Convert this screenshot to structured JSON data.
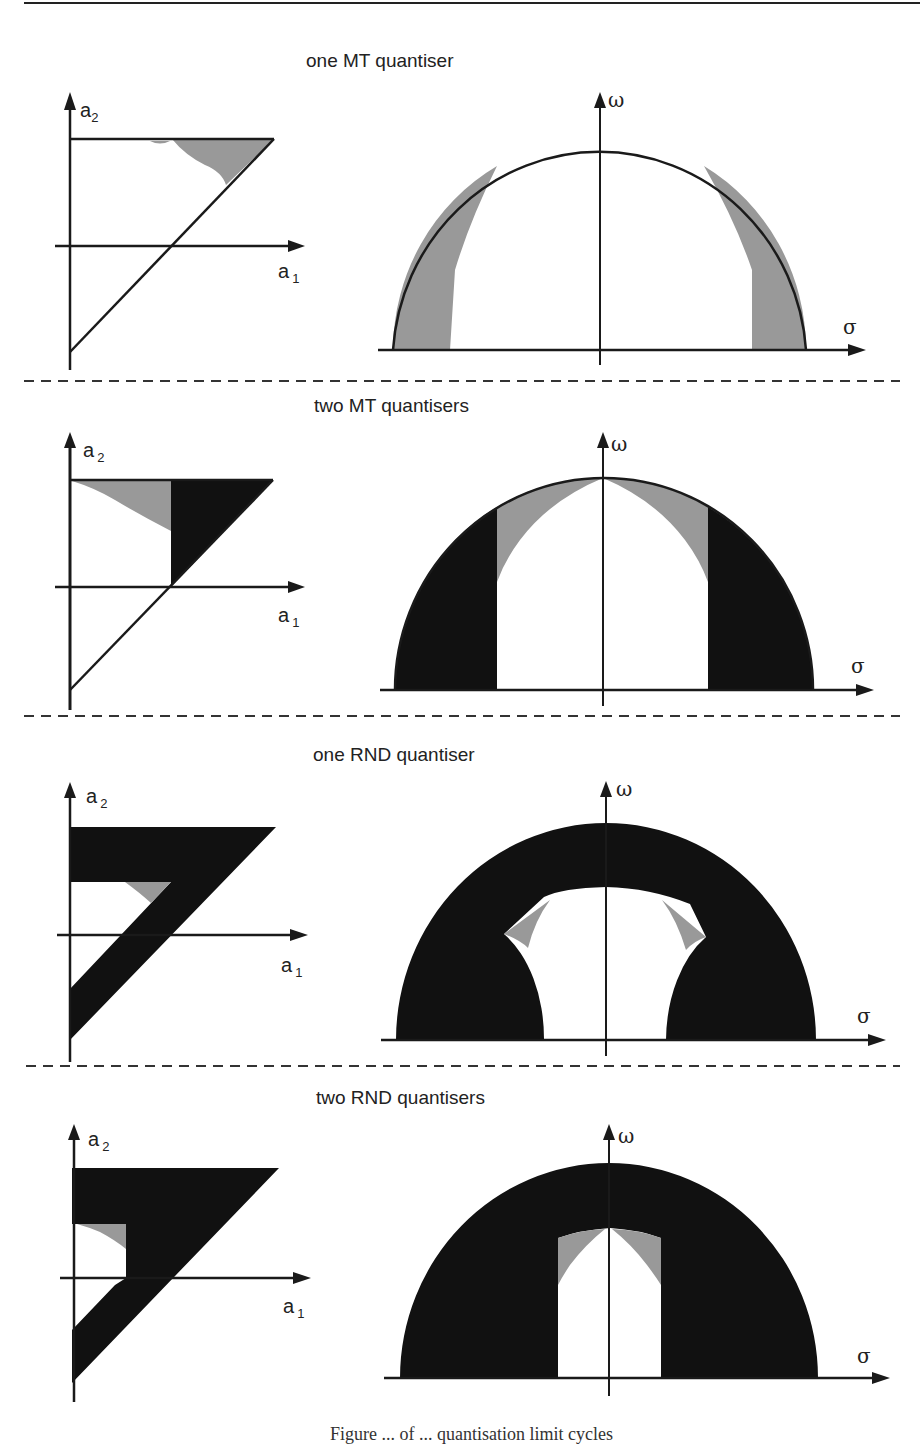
{
  "figure": {
    "colors": {
      "ink": "#1a1a1a",
      "gray": "#999999",
      "black_region": "#111111",
      "background": "#ffffff"
    },
    "axis_labels": {
      "a1": "a",
      "a1_sub": "1",
      "a2": "a",
      "a2_sub": "2",
      "omega": "ω",
      "sigma": "σ"
    },
    "rows": [
      {
        "title": "one MT quantiser"
      },
      {
        "title": "two MT quantisers"
      },
      {
        "title": "one RND quantiser"
      },
      {
        "title": "two RND quantisers"
      }
    ],
    "caption_fragment": "Figure ... of ... quantisation limit cycles"
  }
}
